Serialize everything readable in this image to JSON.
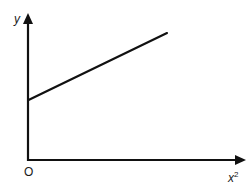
{
  "chart_data": {
    "type": "line",
    "title": "",
    "xlabel": "x²",
    "ylabel": "y",
    "origin_label": "O",
    "grid": false,
    "legend": null,
    "axis_ticks": "none (qualitative sketch)",
    "series": [
      {
        "name": "y vs x²",
        "description": "Straight line with positive gradient and positive y-intercept",
        "x": [
          0,
          1
        ],
        "y": [
          0.4,
          0.85
        ]
      }
    ],
    "xlim": [
      0,
      1.3
    ],
    "ylim": [
      0,
      1.0
    ],
    "colors": {
      "axes": "#111111",
      "line": "#111111",
      "background": "#ffffff"
    }
  },
  "labels": {
    "y_axis": "y",
    "x_axis_base": "x",
    "x_axis_exponent": "2",
    "origin": "O"
  }
}
